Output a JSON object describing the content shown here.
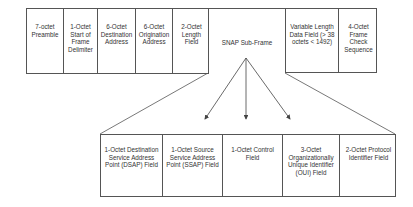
{
  "frame": {
    "fields": [
      {
        "label": "7-octet Preamble"
      },
      {
        "label": "1-Octet Start of Frame Delimiter"
      },
      {
        "label": "6-Octet Destination Address"
      },
      {
        "label": "6-Octet Origination Address"
      },
      {
        "label": "2-Octet Length Field"
      },
      {
        "label": "SNAP Sub-Frame"
      },
      {
        "label": "Variable Length Data Field (> 38 octets < 1492)"
      },
      {
        "label": "4-Octet Frame Check Sequence"
      }
    ]
  },
  "snap_subframe": {
    "fields": [
      {
        "label": "1-Octet Destination Service Address Point (DSAP) Field"
      },
      {
        "label": "1-Octet Source Service Address Point (SSAP) Field"
      },
      {
        "label": "1-Octet Control Field"
      },
      {
        "label": "3-Octet Organizationally Unique Identifier (OUI) Field"
      },
      {
        "label": "2-Octet Protocol Identifier Field"
      }
    ]
  },
  "colors": {
    "line": "#555555",
    "text": "#333333"
  }
}
